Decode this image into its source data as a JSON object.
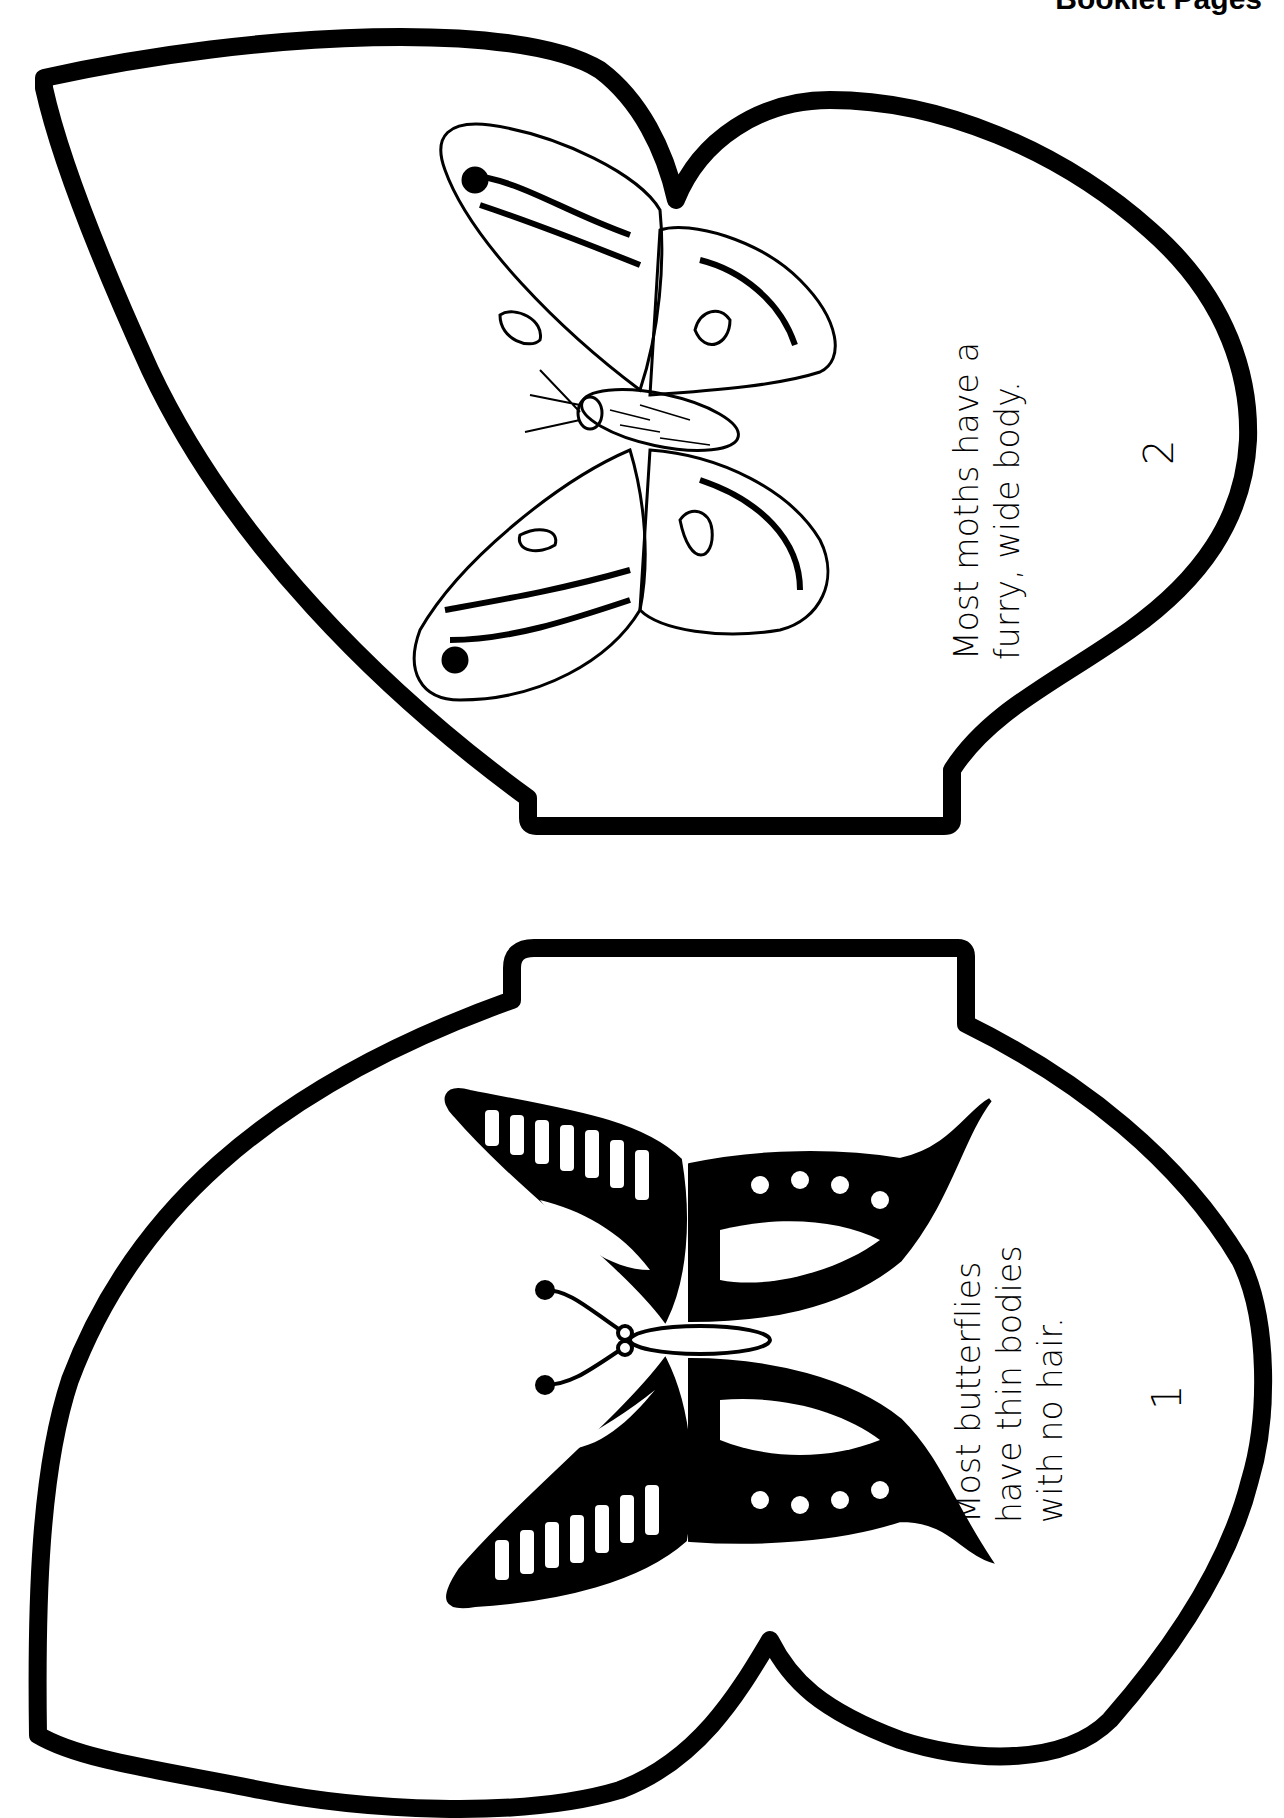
{
  "header": {
    "title": "Booklet Pages"
  },
  "pages": [
    {
      "page_number": "2",
      "subject": "moth",
      "text_lines": [
        "Most moths have a",
        "furry, wide body."
      ],
      "illustration": "moth-illustration"
    },
    {
      "page_number": "1",
      "subject": "butterfly",
      "text_lines": [
        "Most butterflies",
        "have thin bodies",
        "with no hair."
      ],
      "illustration": "swallowtail-butterfly-illustration"
    }
  ],
  "colors": {
    "ink": "#000000",
    "paper": "#ffffff"
  }
}
